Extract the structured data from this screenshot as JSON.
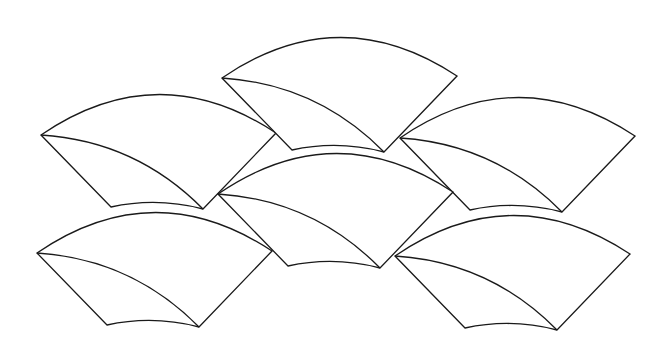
{
  "diagram": {
    "title": "",
    "stroke_color": "#1a1a1a",
    "background_color": "#ffffff",
    "shape_template": {
      "right_corner_offset": [
        235,
        -2
      ],
      "top_arc_control_offset": [
        117,
        -80
      ],
      "bottom_right_offset": [
        162,
        74
      ],
      "bottom_left_offset": [
        70,
        72
      ],
      "bottom_arc_control_offset": [
        116,
        62
      ],
      "inner_curve_control_offset": [
        95,
        6
      ]
    },
    "fans": [
      {
        "id": "fan-upper-left",
        "left_corner": [
          41,
          135
        ]
      },
      {
        "id": "fan-top-center",
        "left_corner": [
          222,
          78
        ]
      },
      {
        "id": "fan-upper-right",
        "left_corner": [
          400,
          138
        ]
      },
      {
        "id": "fan-middle",
        "left_corner": [
          218,
          194
        ]
      },
      {
        "id": "fan-lower-left",
        "left_corner": [
          37,
          253
        ]
      },
      {
        "id": "fan-lower-right",
        "left_corner": [
          395,
          256
        ]
      }
    ]
  }
}
